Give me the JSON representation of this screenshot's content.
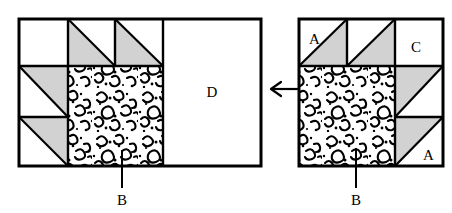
{
  "figure": {
    "title": "",
    "background_color": "#ffffff",
    "stroke_color": "#000000",
    "shade_color": "#d0d0d0",
    "texture_color": "#000000"
  },
  "arrow": {
    "name": "left-arrow",
    "direction": "left",
    "x_start": 303,
    "x_end": 270,
    "y": 89
  },
  "left_figure": {
    "name": "left-diagram",
    "bounds": {
      "x": 19,
      "y": 19,
      "width": 242,
      "height": 147
    },
    "grid": {
      "v_lines": [
        19,
        68,
        115,
        163,
        261
      ],
      "h_lines": [
        19,
        66,
        117,
        166
      ]
    },
    "labels": [
      {
        "id": "D",
        "text": "D",
        "x": 212,
        "y": 97,
        "anchor": "middle"
      },
      {
        "id": "B",
        "text": "B",
        "x": 122,
        "y": 203,
        "anchor": "middle"
      }
    ],
    "leader_line": {
      "x": 122,
      "y_top": 150,
      "y_bottom": 188
    },
    "textured_region": {
      "x": 68,
      "y": 66,
      "width": 95,
      "height": 100,
      "label": "B"
    },
    "plain_region": {
      "x": 163,
      "y": 19,
      "width": 98,
      "height": 147,
      "label": "D"
    },
    "triangles": [
      {
        "id": "t1",
        "cell": [
          68,
          19,
          47,
          47
        ],
        "shade": "lower-left",
        "hyp": "tl-br"
      },
      {
        "id": "t2",
        "cell": [
          115,
          19,
          48,
          47
        ],
        "shade": "lower-left",
        "hyp": "tl-br"
      },
      {
        "id": "t3",
        "cell": [
          19,
          66,
          49,
          51
        ],
        "shade": "upper-right",
        "hyp": "tl-br"
      },
      {
        "id": "t4",
        "cell": [
          19,
          117,
          49,
          49
        ],
        "shade": "upper-right",
        "hyp": "tl-br"
      }
    ],
    "white_cells": [
      {
        "id": "w1",
        "cell": [
          19,
          19,
          49,
          47
        ]
      }
    ]
  },
  "right_figure": {
    "name": "right-diagram",
    "bounds": {
      "x": 299,
      "y": 19,
      "width": 144,
      "height": 147
    },
    "grid": {
      "v_lines": [
        299,
        347,
        395,
        443
      ],
      "h_lines": [
        19,
        66,
        117,
        166
      ]
    },
    "labels": [
      {
        "id": "A-top",
        "text": "A",
        "x": 310,
        "y": 42,
        "anchor": "start"
      },
      {
        "id": "C",
        "text": "C",
        "x": 412,
        "y": 50,
        "anchor": "start"
      },
      {
        "id": "A-bottom",
        "text": "A",
        "x": 424,
        "y": 159,
        "anchor": "start"
      },
      {
        "id": "B",
        "text": "B",
        "x": 356,
        "y": 203,
        "anchor": "middle"
      }
    ],
    "leader_line": {
      "x": 356,
      "y_top": 148,
      "y_bottom": 188
    },
    "textured_region": {
      "x": 299,
      "y": 66,
      "width": 96,
      "height": 100,
      "label": "B"
    },
    "triangles": [
      {
        "id": "rt1",
        "cell": [
          299,
          19,
          48,
          47
        ],
        "shade": "lower-right",
        "hyp": "bl-tr",
        "label": "A"
      },
      {
        "id": "rt2",
        "cell": [
          347,
          19,
          48,
          47
        ],
        "shade": "lower-right",
        "hyp": "bl-tr"
      },
      {
        "id": "rt3",
        "cell": [
          395,
          66,
          48,
          51
        ],
        "shade": "upper-left",
        "hyp": "bl-tr"
      },
      {
        "id": "rt4",
        "cell": [
          395,
          117,
          48,
          49
        ],
        "shade": "upper-left",
        "hyp": "bl-tr",
        "label": "A"
      }
    ],
    "white_cells": [
      {
        "id": "rw1",
        "cell": [
          395,
          19,
          48,
          47
        ],
        "label": "C"
      }
    ]
  }
}
